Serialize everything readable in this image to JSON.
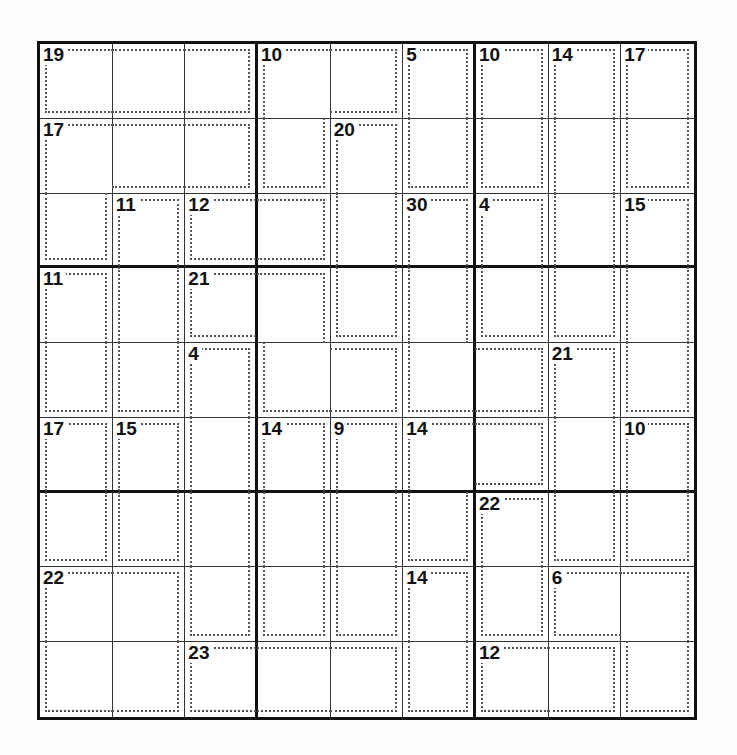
{
  "puzzle": {
    "type": "killer-sudoku",
    "size": 9,
    "cages": [
      {
        "id": "A",
        "sum": 19,
        "cells": [
          [
            0,
            0
          ],
          [
            0,
            1
          ],
          [
            0,
            2
          ]
        ]
      },
      {
        "id": "B",
        "sum": 10,
        "cells": [
          [
            0,
            3
          ],
          [
            0,
            4
          ],
          [
            1,
            3
          ]
        ]
      },
      {
        "id": "C",
        "sum": 5,
        "cells": [
          [
            0,
            5
          ],
          [
            1,
            5
          ]
        ]
      },
      {
        "id": "D",
        "sum": 10,
        "cells": [
          [
            0,
            6
          ],
          [
            1,
            6
          ]
        ]
      },
      {
        "id": "E",
        "sum": 14,
        "cells": [
          [
            0,
            7
          ],
          [
            1,
            7
          ],
          [
            2,
            7
          ],
          [
            3,
            7
          ]
        ]
      },
      {
        "id": "F",
        "sum": 17,
        "cells": [
          [
            0,
            8
          ],
          [
            1,
            8
          ]
        ]
      },
      {
        "id": "G",
        "sum": 17,
        "cells": [
          [
            1,
            0
          ],
          [
            1,
            1
          ],
          [
            1,
            2
          ],
          [
            2,
            0
          ]
        ]
      },
      {
        "id": "H",
        "sum": 20,
        "cells": [
          [
            1,
            4
          ],
          [
            2,
            4
          ],
          [
            3,
            4
          ]
        ]
      },
      {
        "id": "I",
        "sum": 11,
        "cells": [
          [
            2,
            1
          ],
          [
            3,
            1
          ],
          [
            4,
            1
          ]
        ]
      },
      {
        "id": "J",
        "sum": 12,
        "cells": [
          [
            2,
            2
          ],
          [
            2,
            3
          ]
        ]
      },
      {
        "id": "K",
        "sum": 30,
        "cells": [
          [
            2,
            5
          ],
          [
            3,
            5
          ],
          [
            4,
            5
          ],
          [
            4,
            6
          ]
        ]
      },
      {
        "id": "L",
        "sum": 4,
        "cells": [
          [
            2,
            6
          ],
          [
            3,
            6
          ]
        ]
      },
      {
        "id": "M",
        "sum": 15,
        "cells": [
          [
            2,
            8
          ],
          [
            3,
            8
          ],
          [
            4,
            8
          ]
        ]
      },
      {
        "id": "N",
        "sum": 11,
        "cells": [
          [
            3,
            0
          ],
          [
            4,
            0
          ]
        ]
      },
      {
        "id": "O",
        "sum": 21,
        "cells": [
          [
            3,
            2
          ],
          [
            3,
            3
          ],
          [
            4,
            3
          ],
          [
            4,
            4
          ]
        ]
      },
      {
        "id": "P",
        "sum": 4,
        "cells": [
          [
            4,
            2
          ],
          [
            5,
            2
          ],
          [
            6,
            2
          ],
          [
            7,
            2
          ]
        ]
      },
      {
        "id": "Q",
        "sum": 21,
        "cells": [
          [
            4,
            7
          ],
          [
            5,
            7
          ],
          [
            6,
            7
          ]
        ]
      },
      {
        "id": "R",
        "sum": 17,
        "cells": [
          [
            5,
            0
          ],
          [
            6,
            0
          ]
        ]
      },
      {
        "id": "S",
        "sum": 15,
        "cells": [
          [
            5,
            1
          ],
          [
            6,
            1
          ]
        ]
      },
      {
        "id": "T",
        "sum": 14,
        "cells": [
          [
            5,
            3
          ],
          [
            6,
            3
          ],
          [
            7,
            3
          ]
        ]
      },
      {
        "id": "U",
        "sum": 9,
        "cells": [
          [
            5,
            4
          ],
          [
            6,
            4
          ],
          [
            7,
            4
          ]
        ]
      },
      {
        "id": "V",
        "sum": 14,
        "cells": [
          [
            5,
            5
          ],
          [
            5,
            6
          ],
          [
            6,
            5
          ]
        ]
      },
      {
        "id": "W",
        "sum": 10,
        "cells": [
          [
            5,
            8
          ],
          [
            6,
            8
          ]
        ]
      },
      {
        "id": "X",
        "sum": 22,
        "cells": [
          [
            6,
            6
          ],
          [
            7,
            6
          ]
        ]
      },
      {
        "id": "Y",
        "sum": 22,
        "cells": [
          [
            7,
            0
          ],
          [
            7,
            1
          ],
          [
            8,
            0
          ],
          [
            8,
            1
          ]
        ]
      },
      {
        "id": "Z",
        "sum": 6,
        "cells": [
          [
            7,
            7
          ],
          [
            7,
            8
          ],
          [
            8,
            8
          ]
        ]
      },
      {
        "id": "AA",
        "sum": 23,
        "cells": [
          [
            8,
            2
          ],
          [
            8,
            3
          ],
          [
            8,
            4
          ]
        ]
      },
      {
        "id": "AB",
        "sum": 14,
        "cells": [
          [
            7,
            5
          ],
          [
            8,
            5
          ]
        ]
      },
      {
        "id": "AC",
        "sum": 12,
        "cells": [
          [
            8,
            6
          ],
          [
            8,
            7
          ]
        ]
      }
    ]
  }
}
